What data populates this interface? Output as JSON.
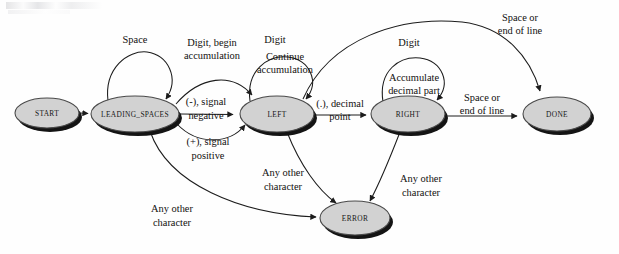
{
  "diagram": {
    "kind": "state-machine",
    "colors": {
      "node_fill": "#d2d2d2",
      "node_stroke": "#4a4a4a",
      "shadow": "#141414",
      "edge": "#1c1c1c",
      "text": "#12100f",
      "background": "#fefefe"
    },
    "nodes": [
      {
        "id": "start",
        "label": "START",
        "cx": 47,
        "cy": 113,
        "rx": 32,
        "ry": 15
      },
      {
        "id": "leading_spaces",
        "label": "LEADING_SPACES",
        "cx": 135,
        "cy": 114,
        "rx": 44,
        "ry": 18
      },
      {
        "id": "left",
        "label": "LEFT",
        "cx": 277,
        "cy": 114,
        "rx": 37,
        "ry": 18
      },
      {
        "id": "right",
        "label": "RIGHT",
        "cx": 408,
        "cy": 114,
        "rx": 37,
        "ry": 18
      },
      {
        "id": "done",
        "label": "DONE",
        "cx": 557,
        "cy": 114,
        "rx": 34,
        "ry": 17
      },
      {
        "id": "error",
        "label": "ERROR",
        "cx": 355,
        "cy": 218,
        "rx": 35,
        "ry": 17
      }
    ],
    "edges": [
      {
        "id": "e-start-leading",
        "from": "start",
        "to": "leading_spaces",
        "label": ""
      },
      {
        "id": "e-leading-self",
        "from": "leading_spaces",
        "to": "leading_spaces",
        "label": "Space"
      },
      {
        "id": "e-leading-left-digit",
        "from": "leading_spaces",
        "to": "left",
        "label": "Digit, begin\naccumulation"
      },
      {
        "id": "e-leading-left-minus",
        "from": "leading_spaces",
        "to": "left",
        "label": "(-), signal\nnegative"
      },
      {
        "id": "e-leading-left-plus",
        "from": "leading_spaces",
        "to": "left",
        "label": "(+), signal\npositive"
      },
      {
        "id": "e-left-self",
        "from": "left",
        "to": "left",
        "label": "Digit",
        "label2": "Continue\naccumulation"
      },
      {
        "id": "e-left-right",
        "from": "left",
        "to": "right",
        "label": "(.), decimal\npoint"
      },
      {
        "id": "e-right-self",
        "from": "right",
        "to": "right",
        "label": "Digit",
        "label2": "Accumulate\ndecimal part"
      },
      {
        "id": "e-right-done",
        "from": "right",
        "to": "done",
        "label": "Space or\nend of line"
      },
      {
        "id": "e-left-done",
        "from": "left",
        "to": "done",
        "label": "Space or\nend of line"
      },
      {
        "id": "e-leading-error",
        "from": "leading_spaces",
        "to": "error",
        "label": "Any other\ncharacter"
      },
      {
        "id": "e-left-error",
        "from": "left",
        "to": "error",
        "label": "Any other\ncharacter"
      },
      {
        "id": "e-right-error",
        "from": "right",
        "to": "error",
        "label": "Any other\ncharacter"
      }
    ],
    "labels": {
      "space": "Space",
      "digit_begin_1": "Digit, begin",
      "digit_begin_2": "accumulation",
      "digit_left": "Digit",
      "continue_1": "Continue",
      "continue_2": "accumulation",
      "minus_1": "(-), signal",
      "minus_2": "negative",
      "plus_1": "(+), signal",
      "plus_2": "positive",
      "decimal_1": "(.), decimal",
      "decimal_2": "point",
      "digit_right": "Digit",
      "accumulate_1": "Accumulate",
      "accumulate_2": "decimal part",
      "space_eol_top_1": "Space or",
      "space_eol_top_2": "end of line",
      "space_eol_mid_1": "Space or",
      "space_eol_mid_2": "end of line",
      "any_other_left_1": "Any other",
      "any_other_left_2": "character",
      "any_other_mid_1": "Any other",
      "any_other_mid_2": "character",
      "any_other_right_1": "Any other",
      "any_other_right_2": "character"
    },
    "node_labels": {
      "start": "START",
      "leading_spaces": "LEADING_SPACES",
      "left": "LEFT",
      "right": "RIGHT",
      "done": "DONE",
      "error": "ERROR"
    }
  }
}
